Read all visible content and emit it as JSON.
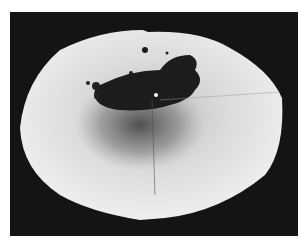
{
  "image": {
    "description": "Grayscale photograph of a roughly elliptical paper disk on a dark background with a dark splatter stain near the center",
    "colors": {
      "background": "#141414",
      "paper": "#ebebeb",
      "stain": "#1a1a1a",
      "border": "#ffffff"
    }
  }
}
